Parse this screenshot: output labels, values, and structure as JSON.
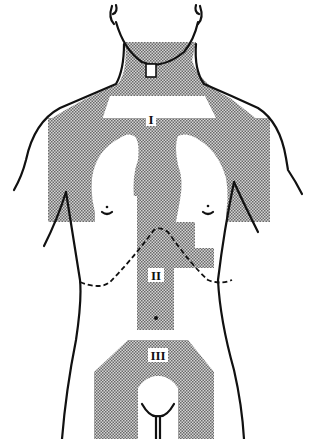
{
  "figure": {
    "type": "anatomical-diagram",
    "shade_color": "#9a9a9a",
    "line_color": "#111111",
    "background": "#ffffff"
  },
  "regions": [
    {
      "id": "region-1",
      "label": "I",
      "description": "neck, shoulders and chest region surrounding lungs"
    },
    {
      "id": "region-2",
      "label": "II",
      "description": "upper abdomen / epigastric region"
    },
    {
      "id": "region-3",
      "label": "III",
      "description": "lower abdomen and groin region"
    }
  ],
  "annotations": {
    "dashed_line": "costal margin"
  }
}
